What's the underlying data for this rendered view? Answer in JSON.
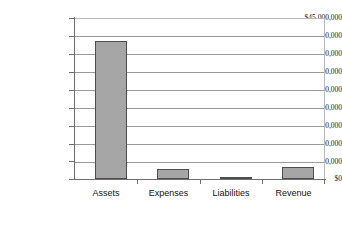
{
  "chart_data": {
    "type": "bar",
    "title": "",
    "xlabel": "",
    "ylabel": "",
    "categories": [
      "Assets",
      "Expenses",
      "Liabilities",
      "Revenue"
    ],
    "values": [
      38800000,
      2800000,
      250000,
      3500000
    ],
    "ylim": [
      0,
      45000000
    ],
    "ytick_values": [
      0,
      5000000,
      10000000,
      15000000,
      20000000,
      25000000,
      30000000,
      35000000,
      40000000,
      45000000
    ],
    "ytick_labels": [
      "$0",
      "$5,000,000",
      "$10,000,000",
      "$15,000,000",
      "$20,000,000",
      "$25,000,000",
      "$30,000,000",
      "$35,000,000",
      "$40,000,000",
      "$45,000,000"
    ],
    "grid": true,
    "legend": false,
    "legend_position": "none",
    "bar_fill_color": "#a6a6a6",
    "bar_border_color": "#4d4d4d",
    "gridline_color": "#9a9a9a",
    "axis_color": "#6e6e6e",
    "background_color": "#ffffff"
  }
}
